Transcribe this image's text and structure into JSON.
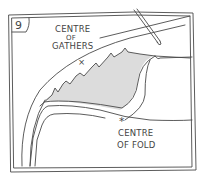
{
  "figure": {
    "number": "9",
    "labels": {
      "gathers_line1": "CENTRE",
      "gathers_line2": "OF",
      "gathers_line3": "GATHERS",
      "fold_line1": "CENTRE",
      "fold_line2": "OF FOLD"
    },
    "markers": {
      "gathers_mark": "×",
      "fold_mark": "*"
    },
    "colors": {
      "ink": "#4a4a4a",
      "shading": "#d9d9d9",
      "paper": "#ffffff"
    }
  }
}
